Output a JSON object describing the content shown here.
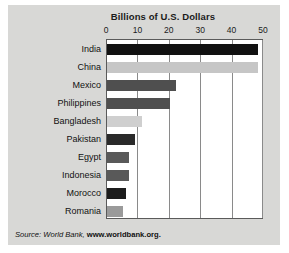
{
  "chart_data": {
    "type": "bar",
    "orientation": "horizontal",
    "title": "Billions of U.S. Dollars",
    "xlabel": "",
    "ylabel": "",
    "xlim": [
      0,
      50
    ],
    "xticks": [
      "0",
      "10",
      "20",
      "30",
      "40",
      "50"
    ],
    "grid": true,
    "legend": null,
    "categories": [
      "India",
      "China",
      "Mexico",
      "Philippines",
      "Bangladesh",
      "Pakistan",
      "Egypt",
      "Indonesia",
      "Morocco",
      "Romania"
    ],
    "values": [
      48,
      48,
      22,
      20,
      11,
      9,
      7,
      7,
      6,
      5
    ],
    "bar_colors": [
      "#111111",
      "#c6c6c6",
      "#4f4f4f",
      "#4f4f4f",
      "#cfcfcf",
      "#2a2a2a",
      "#595959",
      "#595959",
      "#1c1c1c",
      "#9a9a9a"
    ]
  },
  "source": {
    "prefix": "Source: World Bank, ",
    "url": "www.worldbank.org",
    "tail": "."
  },
  "colors": {
    "panel_background": "#d8d8d6",
    "plot_background": "#ffffff",
    "gridline": "#8a8a8a",
    "axis": "#5a5a5a",
    "text": "#111111"
  }
}
